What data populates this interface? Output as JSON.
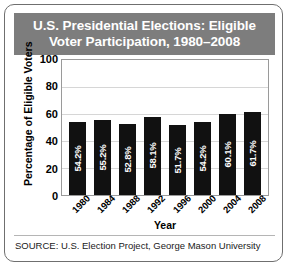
{
  "card": {
    "title": "U.S. Presidential Elections: Eligible\nVoter Participation, 1980–2008",
    "source": "SOURCE: U.S. Election Project, George Mason University"
  },
  "colors": {
    "title_band": "#7d7d7d",
    "title_text": "#ffffff",
    "bar": "#111111",
    "bar_value_text": "#ffffff",
    "gridline": "#d6d6d6",
    "plot_border": "#9a9a9a",
    "card_border": "#6f6f6f",
    "plot_background": "#ffffff"
  },
  "chart_data": {
    "type": "bar",
    "title": "U.S. Presidential Elections: Eligible Voter Participation, 1980–2008",
    "xlabel": "Year",
    "ylabel": "Percentage of Eligible Voters",
    "categories": [
      "1980",
      "1984",
      "1988",
      "1992",
      "1996",
      "2000",
      "2004",
      "2008"
    ],
    "values": [
      54.2,
      55.2,
      52.8,
      58.1,
      51.7,
      54.2,
      60.1,
      61.7
    ],
    "data_labels": [
      "54.2%",
      "55.2%",
      "52.8%",
      "58.1%",
      "51.7%",
      "54.2%",
      "60.1%",
      "61.7%"
    ],
    "ylim": [
      0,
      100
    ],
    "yticks": [
      100,
      80,
      60,
      40,
      20,
      0
    ],
    "ytick_labels": [
      "100",
      "80",
      "60",
      "40",
      "20",
      "0"
    ],
    "grid": true,
    "legend": false,
    "source": "SOURCE: U.S. Election Project, George Mason University"
  }
}
